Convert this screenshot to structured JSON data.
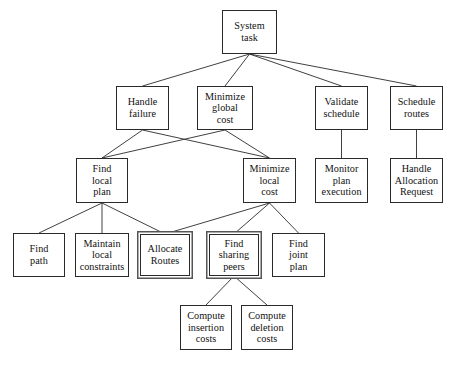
{
  "diagram": {
    "type": "task-decomposition-tree",
    "canvas": {
      "width": 453,
      "height": 366
    },
    "style": {
      "node_fill": "#ffffff",
      "node_border": "#2a2a2a",
      "edge_color": "#2a2a2a",
      "highlight_border": "#555555",
      "text_color": "#111111"
    },
    "nodes": [
      {
        "id": "system_task",
        "label": "System task",
        "lines": [
          "System",
          "task"
        ],
        "x": 222,
        "y": 10,
        "w": 55,
        "h": 44,
        "highlighted": false,
        "level": 0
      },
      {
        "id": "handle_failure",
        "label": "Handle failure",
        "lines": [
          "Handle",
          "failure"
        ],
        "x": 116,
        "y": 86,
        "w": 53,
        "h": 44,
        "highlighted": false,
        "level": 1
      },
      {
        "id": "minimize_global",
        "label": "Minimize global cost",
        "lines": [
          "Minimize",
          "global",
          "cost"
        ],
        "x": 197,
        "y": 86,
        "w": 56,
        "h": 44,
        "highlighted": false,
        "level": 1
      },
      {
        "id": "validate_schedule",
        "label": "Validate schedule",
        "lines": [
          "Validate",
          "schedule"
        ],
        "x": 315,
        "y": 86,
        "w": 53,
        "h": 44,
        "highlighted": false,
        "level": 1
      },
      {
        "id": "schedule_routes",
        "label": "Schedule routes",
        "lines": [
          "Schedule",
          "routes"
        ],
        "x": 390,
        "y": 86,
        "w": 53,
        "h": 44,
        "highlighted": false,
        "level": 1
      },
      {
        "id": "find_local_plan",
        "label": "Find local plan",
        "lines": [
          "Find",
          "local",
          "plan"
        ],
        "x": 76,
        "y": 158,
        "w": 52,
        "h": 45,
        "highlighted": false,
        "level": 2
      },
      {
        "id": "minimize_local",
        "label": "Minimize local cost",
        "lines": [
          "Minimize",
          "local",
          "cost"
        ],
        "x": 243,
        "y": 158,
        "w": 53,
        "h": 45,
        "highlighted": false,
        "level": 2
      },
      {
        "id": "monitor_plan",
        "label": "Monitor plan execution",
        "lines": [
          "Monitor",
          "plan",
          "execution"
        ],
        "x": 315,
        "y": 158,
        "w": 53,
        "h": 45,
        "highlighted": false,
        "level": 2
      },
      {
        "id": "handle_allocation",
        "label": "Handle Allocation Request",
        "lines": [
          "Handle",
          "Allocation",
          "Request"
        ],
        "x": 390,
        "y": 158,
        "w": 53,
        "h": 45,
        "highlighted": false,
        "level": 2
      },
      {
        "id": "find_path",
        "label": "Find path",
        "lines": [
          "Find",
          "path"
        ],
        "x": 13,
        "y": 233,
        "w": 52,
        "h": 44,
        "highlighted": false,
        "level": 3
      },
      {
        "id": "maintain_local",
        "label": "Maintain local constraints",
        "lines": [
          "Maintain",
          "local",
          "constraints"
        ],
        "x": 75,
        "y": 233,
        "w": 54,
        "h": 44,
        "highlighted": false,
        "level": 3
      },
      {
        "id": "allocate_routes",
        "label": "Allocate Routes",
        "lines": [
          "Allocate",
          "Routes"
        ],
        "x": 140,
        "y": 234,
        "w": 50,
        "h": 42,
        "highlighted": true,
        "level": 3
      },
      {
        "id": "find_sharing_peers",
        "label": "Find sharing peers",
        "lines": [
          "Find",
          "sharing",
          "peers"
        ],
        "x": 209,
        "y": 234,
        "w": 50,
        "h": 42,
        "highlighted": true,
        "level": 3
      },
      {
        "id": "find_joint_plan",
        "label": "Find joint plan",
        "lines": [
          "Find",
          "joint",
          "plan"
        ],
        "x": 272,
        "y": 233,
        "w": 53,
        "h": 44,
        "highlighted": false,
        "level": 3
      },
      {
        "id": "compute_insertion",
        "label": "Compute insertion costs",
        "lines": [
          "Compute",
          "insertion",
          "costs"
        ],
        "x": 180,
        "y": 305,
        "w": 52,
        "h": 45,
        "highlighted": false,
        "level": 4
      },
      {
        "id": "compute_deletion",
        "label": "Compute deletion costs",
        "lines": [
          "Compute",
          "deletion",
          "costs"
        ],
        "x": 241,
        "y": 305,
        "w": 52,
        "h": 45,
        "highlighted": false,
        "level": 4
      }
    ],
    "edges": [
      {
        "from": "system_task",
        "to": "handle_failure"
      },
      {
        "from": "system_task",
        "to": "minimize_global"
      },
      {
        "from": "system_task",
        "to": "validate_schedule"
      },
      {
        "from": "system_task",
        "to": "schedule_routes"
      },
      {
        "from": "handle_failure",
        "to": "find_local_plan"
      },
      {
        "from": "handle_failure",
        "to": "minimize_local"
      },
      {
        "from": "minimize_global",
        "to": "find_local_plan"
      },
      {
        "from": "minimize_global",
        "to": "minimize_local"
      },
      {
        "from": "validate_schedule",
        "to": "monitor_plan"
      },
      {
        "from": "schedule_routes",
        "to": "handle_allocation"
      },
      {
        "from": "find_local_plan",
        "to": "find_path"
      },
      {
        "from": "find_local_plan",
        "to": "maintain_local"
      },
      {
        "from": "find_local_plan",
        "to": "allocate_routes"
      },
      {
        "from": "minimize_local",
        "to": "allocate_routes"
      },
      {
        "from": "minimize_local",
        "to": "find_sharing_peers"
      },
      {
        "from": "minimize_local",
        "to": "find_joint_plan"
      },
      {
        "from": "find_sharing_peers",
        "to": "compute_insertion"
      },
      {
        "from": "find_sharing_peers",
        "to": "compute_deletion"
      }
    ]
  }
}
